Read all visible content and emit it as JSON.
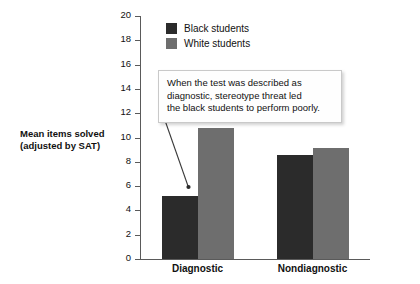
{
  "chart_data": {
    "type": "bar",
    "title": "",
    "xlabel": "",
    "ylabel": "Mean items solved (adjusted by SAT)",
    "categories": [
      "Diagnostic",
      "Nondiagnostic"
    ],
    "series": [
      {
        "name": "Black students",
        "color": "#2b2b2b",
        "values": [
          5.2,
          8.6
        ]
      },
      {
        "name": "White students",
        "color": "#6e6e6e",
        "values": [
          10.8,
          9.1
        ]
      }
    ],
    "ylim": [
      0,
      20
    ],
    "ytick_labels": [
      "0",
      "2",
      "4",
      "6",
      "8",
      "10",
      "12",
      "14",
      "16",
      "18",
      "20"
    ],
    "ytick_values": [
      0,
      2,
      4,
      6,
      8,
      10,
      12,
      14,
      16,
      18,
      20
    ],
    "grid": false,
    "legend_position": "top-left",
    "annotations": [
      {
        "text": "When the test was described as diagnostic, stereotype threat led the black students to perform poorly.",
        "lines": [
          "When the test was described as",
          "diagnostic, stereotype threat led",
          "the black students to perform poorly."
        ],
        "points_to": {
          "category": "Diagnostic",
          "series": "Black students"
        }
      }
    ]
  },
  "axis": {
    "y_title_line1": "Mean items solved",
    "y_title_line2": "(adjusted by SAT)"
  },
  "legend": {
    "items": [
      {
        "label": "Black students",
        "color": "#2b2b2b"
      },
      {
        "label": "White students",
        "color": "#6e6e6e"
      }
    ]
  },
  "colors": {
    "black_students": "#2b2b2b",
    "white_students": "#6e6e6e",
    "axis": "#5a5a5a",
    "text": "#111111",
    "callout_border": "#c9c9c9",
    "background": "#ffffff"
  }
}
